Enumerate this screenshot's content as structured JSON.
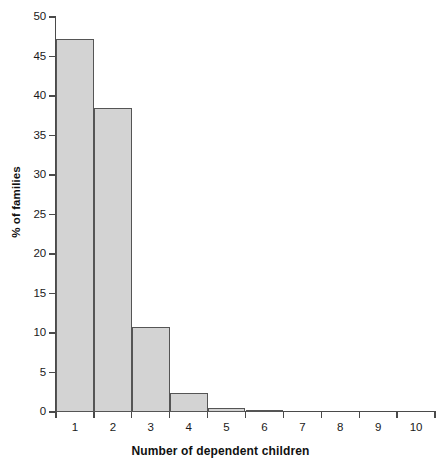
{
  "chart_data": {
    "type": "bar",
    "title": "",
    "subtitle": "",
    "xlabel": "Number of dependent children",
    "ylabel": "% of families",
    "categories": [
      "1",
      "2",
      "3",
      "4",
      "5",
      "6",
      "7",
      "8",
      "9",
      "10"
    ],
    "values": [
      47.2,
      38.5,
      10.7,
      2.4,
      0.5,
      0.1,
      0.0,
      0.0,
      0.0,
      0.0
    ],
    "series": [
      {
        "name": "% of families",
        "values": [
          47.2,
          38.5,
          10.7,
          2.4,
          0.5,
          0.1,
          0.0,
          0.0,
          0.0,
          0.0
        ]
      }
    ],
    "ylim": [
      0,
      50
    ],
    "ytick_labels": [
      "0",
      "5",
      "10",
      "15",
      "20",
      "25",
      "30",
      "35",
      "40",
      "45",
      "50"
    ],
    "ytick_values": [
      0,
      5,
      10,
      15,
      20,
      25,
      30,
      35,
      40,
      45,
      50
    ],
    "xtick_labels": [
      "1",
      "2",
      "3",
      "4",
      "5",
      "6",
      "7",
      "8",
      "9",
      "10"
    ],
    "grid": false,
    "legend": false,
    "legend_position": "none",
    "bar_fill_color": "#d3d3d3",
    "bar_border_color": "#555555",
    "axis_color": "#4a4a4a",
    "background_color": "#ffffff",
    "annotations": []
  }
}
